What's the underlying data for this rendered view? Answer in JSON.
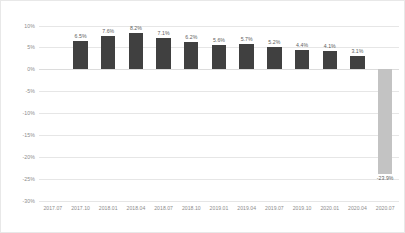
{
  "chart_data": {
    "type": "bar",
    "title": "",
    "subtitle": "",
    "xlabel": "",
    "ylabel": "",
    "categories": [
      "2017.07",
      "2017.10",
      "2018.01",
      "2018.04",
      "2018.07",
      "2018.10",
      "2019.01",
      "2019.04",
      "2019.07",
      "2019.10",
      "2020.01",
      "2020.04",
      "2020.07"
    ],
    "values": [
      null,
      6.5,
      7.6,
      8.2,
      7.1,
      6.2,
      5.6,
      5.7,
      5.2,
      4.4,
      4.1,
      3.1,
      -23.9
    ],
    "data_labels": [
      "",
      "6.5%",
      "7.6%",
      "8.2%",
      "7.1%",
      "6.2%",
      "5.6%",
      "5.7%",
      "5.2%",
      "4.4%",
      "4.1%",
      "3.1%",
      "-23.9%"
    ],
    "ylim": [
      -30,
      10
    ],
    "ytick_values": [
      10,
      5,
      0,
      -5,
      -10,
      -15,
      -20,
      -25,
      -30
    ],
    "ytick_labels": [
      "10%",
      "5%",
      "0%",
      "-5%",
      "-10%",
      "-15%",
      "-20%",
      "-25%",
      "-30%"
    ],
    "grid": true,
    "legend": false,
    "legend_position": "none",
    "colors": {
      "bar_positive": "#404040",
      "bar_negative": "#c3c3c3",
      "gridline": "#e6e6e6",
      "axis_text": "#8c8c8c",
      "label_text": "#5e5e5e",
      "background": "#ffffff",
      "border": "#e8e8e8"
    }
  }
}
